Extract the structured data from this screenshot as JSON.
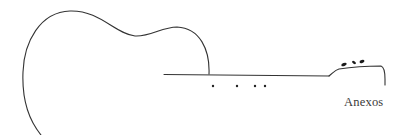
{
  "illustration": {
    "subject": "guitar-outline",
    "stroke_color": "#333333",
    "fret_marker_count": 4,
    "tuning_peg_count": 3
  },
  "caption": {
    "text": "Anexos"
  }
}
